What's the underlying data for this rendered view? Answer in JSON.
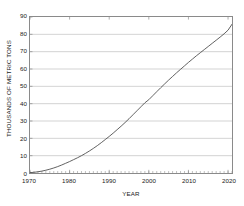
{
  "chart_data": {
    "type": "line",
    "title": "",
    "xlabel": "YEAR",
    "ylabel": "THOUSANDS OF METRIC TONS",
    "xlim": [
      1970,
      2021
    ],
    "ylim": [
      0,
      90
    ],
    "xticks": [
      1970,
      1980,
      1990,
      2000,
      2010,
      2020
    ],
    "xtick_labels": [
      "1970",
      "1980",
      "1990",
      "2000",
      "2010",
      "2020"
    ],
    "x_minor_tick_step": 1,
    "yticks": [
      0,
      10,
      20,
      30,
      40,
      50,
      60,
      70,
      80,
      90
    ],
    "ytick_labels": [
      "0",
      "10",
      "20",
      "30",
      "40",
      "50",
      "60",
      "70",
      "80",
      "90"
    ],
    "grid": "horizontal",
    "legend": "none",
    "series": [
      {
        "name": "",
        "color": "#444444",
        "x": [
          1970,
          1971,
          1972,
          1973,
          1974,
          1975,
          1976,
          1977,
          1978,
          1979,
          1980,
          1981,
          1982,
          1983,
          1984,
          1985,
          1986,
          1987,
          1988,
          1989,
          1990,
          1991,
          1992,
          1993,
          1994,
          1995,
          1996,
          1997,
          1998,
          1999,
          2000,
          2001,
          2002,
          2003,
          2004,
          2005,
          2006,
          2007,
          2008,
          2009,
          2010,
          2011,
          2012,
          2013,
          2014,
          2015,
          2016,
          2017,
          2018,
          2019,
          2020,
          2021
        ],
        "values": [
          0.2,
          0.4,
          0.7,
          1.1,
          1.6,
          2.2,
          2.9,
          3.7,
          4.6,
          5.6,
          6.6,
          7.7,
          8.8,
          10.0,
          11.3,
          12.7,
          14.2,
          15.8,
          17.5,
          19.3,
          21.1,
          23.0,
          25.0,
          27.0,
          29.1,
          31.3,
          33.6,
          35.9,
          38.2,
          40.5,
          42.3,
          44.6,
          46.9,
          49.2,
          51.4,
          53.6,
          55.7,
          57.8,
          59.8,
          61.8,
          63.8,
          65.7,
          67.6,
          69.4,
          71.2,
          73.0,
          74.8,
          76.6,
          78.4,
          80.3,
          82.4,
          85.8
        ]
      }
    ]
  },
  "figure": {
    "background_color": "#ffffff",
    "grid_color": "#b5b5b5",
    "frame_color": "#8a8a8a",
    "line_color": "#444444",
    "text_color": "#1a1a1a"
  }
}
